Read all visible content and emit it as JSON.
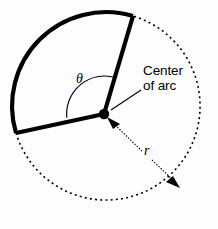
{
  "figure": {
    "name": "circular-sector-arc-diagram",
    "background_color": "#fdfdfd",
    "stroke_color": "#000000",
    "width": 218,
    "height": 229
  },
  "labels": {
    "center_of_arc": "Center\nof arc",
    "theta": "θ",
    "radius": "r"
  },
  "geometry": {
    "center": {
      "x": 104,
      "y": 114
    },
    "radius": 94,
    "solid_arc": {
      "start": {
        "x": 133,
        "y": 16
      },
      "end": {
        "x": 16,
        "y": 133
      },
      "sweep": "counterclockwise",
      "stroke_width": 4.2
    },
    "dashed_arc": {
      "start": {
        "x": 16,
        "y": 133
      },
      "end": {
        "x": 133,
        "y": 16
      },
      "sweep": "counterclockwise",
      "stroke_width": 1.6,
      "dash_pattern": "2 3.2"
    },
    "radii": [
      {
        "from": {
          "x": 104,
          "y": 114
        },
        "to": {
          "x": 133,
          "y": 16
        }
      },
      {
        "from": {
          "x": 104,
          "y": 114
        },
        "to": {
          "x": 16,
          "y": 133
        }
      }
    ],
    "angle_arc_radius": 38,
    "center_dot_radius": 5.2,
    "radius_arrow": {
      "from": {
        "x": 110,
        "y": 120
      },
      "to": {
        "x": 178,
        "y": 186
      },
      "double_headed": true
    },
    "leader_line": {
      "from": {
        "x": 141,
        "y": 90
      },
      "to": {
        "x": 110,
        "y": 110
      }
    }
  },
  "icons": {
    "center_dot": "filled-dot-icon",
    "arrow_head_inner": "arrowhead-icon",
    "arrow_head_outer": "arrowhead-icon"
  }
}
